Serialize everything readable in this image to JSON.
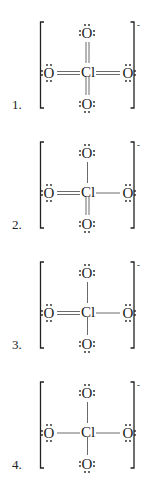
{
  "ion_charge": "-",
  "central_atom": "Cl",
  "outer_atom": "O",
  "structures": [
    {
      "label": "1.",
      "bonds": {
        "top": 2,
        "left": 2,
        "right": 2,
        "bottom": 2
      }
    },
    {
      "label": "2.",
      "bonds": {
        "top": 1,
        "left": 2,
        "right": 1,
        "bottom": 2
      }
    },
    {
      "label": "3.",
      "bonds": {
        "top": 1,
        "left": 2,
        "right": 1,
        "bottom": 1
      }
    },
    {
      "label": "4.",
      "bonds": {
        "top": 1,
        "left": 1,
        "right": 1,
        "bottom": 1
      }
    }
  ]
}
